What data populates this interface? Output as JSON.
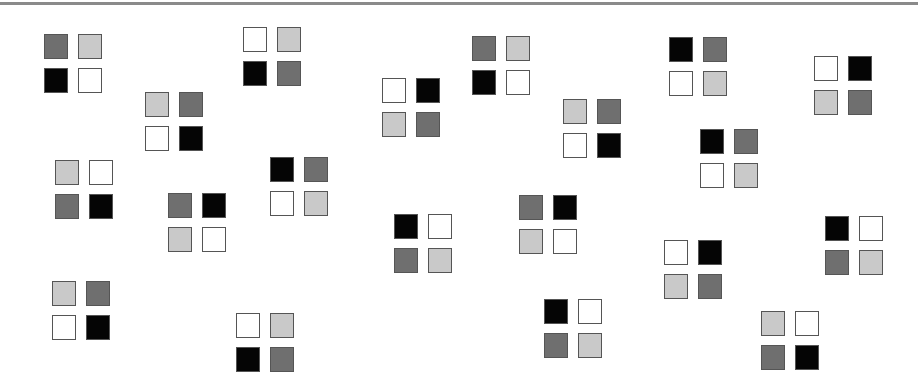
{
  "colors": {
    "D": "#6f6f6f",
    "L": "#c9c9c9",
    "K": "#050505",
    "W": "#ffffff",
    "border": "#555555",
    "topline": "#8a8a8a"
  },
  "grids": [
    {
      "x": 44,
      "y": 34,
      "cells": [
        "D",
        "L",
        "K",
        "W"
      ]
    },
    {
      "x": 243,
      "y": 27,
      "cells": [
        "W",
        "L",
        "K",
        "D"
      ]
    },
    {
      "x": 145,
      "y": 92,
      "cells": [
        "L",
        "D",
        "W",
        "K"
      ]
    },
    {
      "x": 382,
      "y": 78,
      "cells": [
        "W",
        "K",
        "L",
        "D"
      ]
    },
    {
      "x": 472,
      "y": 36,
      "cells": [
        "D",
        "L",
        "K",
        "W"
      ]
    },
    {
      "x": 563,
      "y": 99,
      "cells": [
        "L",
        "D",
        "W",
        "K"
      ]
    },
    {
      "x": 669,
      "y": 37,
      "cells": [
        "K",
        "D",
        "W",
        "L"
      ]
    },
    {
      "x": 814,
      "y": 56,
      "cells": [
        "W",
        "K",
        "L",
        "D"
      ]
    },
    {
      "x": 55,
      "y": 160,
      "cells": [
        "L",
        "W",
        "D",
        "K"
      ]
    },
    {
      "x": 168,
      "y": 193,
      "cells": [
        "D",
        "K",
        "L",
        "W"
      ]
    },
    {
      "x": 270,
      "y": 157,
      "cells": [
        "K",
        "D",
        "W",
        "L"
      ]
    },
    {
      "x": 394,
      "y": 214,
      "cells": [
        "K",
        "W",
        "D",
        "L"
      ]
    },
    {
      "x": 519,
      "y": 195,
      "cells": [
        "D",
        "K",
        "L",
        "W"
      ]
    },
    {
      "x": 700,
      "y": 129,
      "cells": [
        "K",
        "D",
        "W",
        "L"
      ]
    },
    {
      "x": 664,
      "y": 240,
      "cells": [
        "W",
        "K",
        "L",
        "D"
      ]
    },
    {
      "x": 825,
      "y": 216,
      "cells": [
        "K",
        "W",
        "D",
        "L"
      ]
    },
    {
      "x": 52,
      "y": 281,
      "cells": [
        "L",
        "D",
        "W",
        "K"
      ]
    },
    {
      "x": 236,
      "y": 313,
      "cells": [
        "W",
        "L",
        "K",
        "D"
      ]
    },
    {
      "x": 544,
      "y": 299,
      "cells": [
        "K",
        "W",
        "D",
        "L"
      ]
    },
    {
      "x": 761,
      "y": 311,
      "cells": [
        "L",
        "W",
        "D",
        "K"
      ]
    }
  ]
}
